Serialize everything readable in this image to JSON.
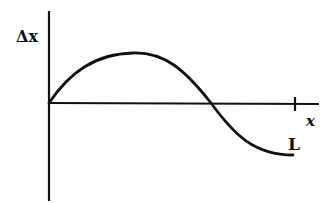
{
  "diagram": {
    "y_axis_label": "Δx",
    "x_axis_label": "x",
    "tick_label": "L",
    "curve": "one full sine period of displacement Δx vs position x from 0 to L: starts at 0, rises to a positive maximum, crosses zero mid-way, falls to a negative minimum at L",
    "colors": {
      "line": "#111111",
      "background": "#ffffff"
    }
  }
}
